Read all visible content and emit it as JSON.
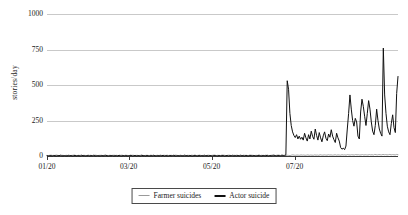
{
  "chart_data": {
    "type": "line",
    "title": "",
    "xlabel": "",
    "ylabel": "stories/day",
    "ylim": [
      0,
      1000
    ],
    "yticks": [
      0,
      250,
      500,
      750,
      1000
    ],
    "ytick_labels": [
      "0",
      "250",
      "500",
      "750",
      "1000"
    ],
    "grid": true,
    "legend_position": "bottom-center",
    "x_axis": {
      "type": "date",
      "tick_labels": [
        "01/20",
        "03/20",
        "05/20",
        "07/20"
      ],
      "tick_values": [
        0,
        60,
        121,
        182
      ],
      "range": [
        0,
        258
      ]
    },
    "series": [
      {
        "name": "Farmer suicides",
        "color": "#9a9a9a",
        "values": [
          4,
          3,
          5,
          6,
          4,
          3,
          5,
          7,
          4,
          3,
          6,
          5,
          4,
          3,
          5,
          4,
          6,
          3,
          4,
          5,
          7,
          4,
          3,
          5,
          4,
          6,
          3,
          5,
          4,
          3,
          6,
          4,
          5,
          3,
          4,
          6,
          5,
          3,
          4,
          5,
          4,
          3,
          6,
          5,
          4,
          3,
          5,
          4,
          3,
          6,
          4,
          5,
          3,
          4,
          5,
          6,
          3,
          4,
          5,
          4,
          3,
          5,
          4,
          6,
          3,
          4,
          5,
          3,
          4,
          6,
          5,
          3,
          4,
          5,
          4,
          3,
          6,
          4,
          5,
          3,
          4,
          5,
          3,
          6,
          4,
          3,
          5,
          4,
          6,
          3,
          4,
          5,
          3,
          4,
          6,
          5,
          3,
          4,
          5,
          3,
          4,
          6,
          3,
          5,
          4,
          3,
          6,
          4,
          5,
          3,
          4,
          5,
          6,
          3,
          4,
          5,
          3,
          4,
          6,
          4,
          3,
          5,
          4,
          6,
          3,
          5,
          4,
          3,
          6,
          4,
          5,
          3,
          4,
          6,
          5,
          3,
          4,
          5,
          4,
          6,
          3,
          4,
          5,
          3,
          6,
          4,
          5,
          3,
          4,
          5,
          6,
          4,
          3,
          5,
          4,
          6,
          3,
          5,
          4,
          3,
          6,
          5,
          4,
          3,
          5,
          6,
          4,
          3,
          5,
          4,
          6,
          3,
          5,
          4,
          6,
          3,
          5,
          4,
          3,
          6,
          8,
          6,
          5,
          7,
          6,
          5,
          8,
          6,
          7,
          5,
          6,
          8,
          5,
          7,
          6,
          5,
          8,
          6,
          7,
          5,
          9,
          7,
          6,
          8,
          7,
          6,
          9,
          7,
          8,
          6,
          7,
          9,
          6,
          8,
          7,
          6,
          9,
          7,
          8,
          6,
          10,
          8,
          7,
          9,
          8,
          7,
          10,
          8,
          9,
          7,
          8,
          10,
          7,
          9,
          8,
          7,
          10,
          8,
          9,
          7,
          11,
          9,
          8,
          10,
          9,
          8,
          11,
          9,
          10,
          8,
          9,
          11,
          8,
          10,
          9,
          8,
          11,
          9
        ]
      },
      {
        "name": "Actor suicide",
        "color": "#111111",
        "values": [
          2,
          1,
          3,
          2,
          1,
          4,
          2,
          1,
          3,
          2,
          5,
          2,
          1,
          3,
          2,
          1,
          4,
          2,
          3,
          1,
          2,
          4,
          1,
          3,
          2,
          1,
          5,
          2,
          3,
          1,
          2,
          4,
          1,
          3,
          2,
          5,
          1,
          2,
          3,
          1,
          2,
          4,
          1,
          3,
          5,
          2,
          1,
          3,
          2,
          4,
          1,
          2,
          3,
          1,
          5,
          2,
          1,
          3,
          2,
          4,
          1,
          2,
          3,
          5,
          1,
          2,
          4,
          1,
          3,
          2,
          1,
          5,
          2,
          3,
          1,
          4,
          2,
          1,
          3,
          2,
          5,
          1,
          2,
          3,
          1,
          4,
          2,
          5,
          1,
          3,
          2,
          1,
          4,
          2,
          3,
          5,
          1,
          2,
          3,
          1,
          4,
          2,
          1,
          5,
          2,
          3,
          1,
          4,
          2,
          1,
          3,
          5,
          2,
          1,
          4,
          2,
          3,
          1,
          5,
          2,
          3,
          1,
          4,
          2,
          1,
          5,
          3,
          2,
          1,
          4,
          2,
          3,
          5,
          1,
          2,
          4,
          1,
          3,
          2,
          5,
          1,
          3,
          2,
          4,
          1,
          5,
          2,
          3,
          1,
          4,
          2,
          1,
          5,
          3,
          2,
          4,
          1,
          2,
          3,
          5,
          2,
          1,
          4,
          3,
          2,
          5,
          1,
          3,
          2,
          4,
          6,
          3,
          2,
          5,
          3,
          2,
          6,
          4,
          3,
          8,
          530,
          470,
          300,
          215,
          170,
          145,
          130,
          150,
          120,
          140,
          118,
          132,
          112,
          160,
          128,
          105,
          150,
          120,
          175,
          138,
          118,
          190,
          145,
          112,
          165,
          128,
          100,
          142,
          170,
          125,
          108,
          155,
          132,
          185,
          140,
          115,
          95,
          160,
          128,
          105,
          60,
          48,
          55,
          45,
          70,
          190,
          300,
          430,
          330,
          250,
          210,
          265,
          240,
          140,
          120,
          310,
          400,
          350,
          280,
          215,
          300,
          390,
          330,
          240,
          175,
          150,
          215,
          330,
          250,
          190,
          160,
          140,
          760,
          430,
          300,
          210,
          170,
          150,
          230,
          290,
          200,
          165,
          440,
          560
        ]
      }
    ]
  },
  "legend": {
    "items": [
      {
        "label": "Farmer suicides",
        "color": "#9a9a9a",
        "width": 1.6
      },
      {
        "label": "Actor suicide",
        "color": "#111111",
        "width": 2.2
      }
    ]
  }
}
